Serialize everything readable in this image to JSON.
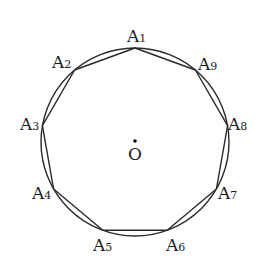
{
  "diagram": {
    "center": {
      "label": "O",
      "x": 135,
      "y": 142
    },
    "circle": {
      "cx": 135,
      "cy": 142,
      "r": 94,
      "stroke": "#2a2a2a"
    },
    "polygon": {
      "stroke": "#2a2a2a"
    },
    "vertices": [
      {
        "name": "A",
        "sub": "1",
        "x": 135.0,
        "y": 48.0,
        "lx": 127,
        "ly": 42,
        "anchor": "start"
      },
      {
        "name": "A",
        "sub": "2",
        "x": 74.6,
        "y": 70.0,
        "lx": 52,
        "ly": 68,
        "anchor": "start"
      },
      {
        "name": "A",
        "sub": "3",
        "x": 42.4,
        "y": 125.7,
        "lx": 20,
        "ly": 130,
        "anchor": "start"
      },
      {
        "name": "A",
        "sub": "4",
        "x": 53.6,
        "y": 189.0,
        "lx": 32,
        "ly": 199,
        "anchor": "start"
      },
      {
        "name": "A",
        "sub": "5",
        "x": 102.8,
        "y": 230.3,
        "lx": 93,
        "ly": 251,
        "anchor": "start"
      },
      {
        "name": "A",
        "sub": "6",
        "x": 167.2,
        "y": 230.3,
        "lx": 166,
        "ly": 251,
        "anchor": "start"
      },
      {
        "name": "A",
        "sub": "7",
        "x": 216.4,
        "y": 189.0,
        "lx": 218,
        "ly": 199,
        "anchor": "start"
      },
      {
        "name": "A",
        "sub": "8",
        "x": 227.6,
        "y": 125.7,
        "lx": 228,
        "ly": 130,
        "anchor": "start"
      },
      {
        "name": "A",
        "sub": "9",
        "x": 195.4,
        "y": 70.0,
        "lx": 198,
        "ly": 70,
        "anchor": "start"
      }
    ]
  }
}
